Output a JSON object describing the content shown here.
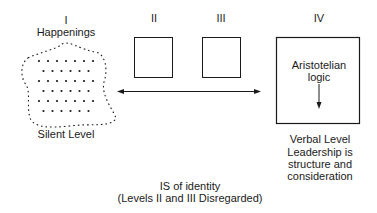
{
  "levels": [
    {
      "numeral": "I",
      "title": "Happenings",
      "caption": "Silent Level"
    },
    {
      "numeral": "II"
    },
    {
      "numeral": "III"
    },
    {
      "numeral": "IV",
      "box_text_line1": "Aristotelian",
      "box_text_line2": "logic",
      "caption": "Verbal Level",
      "statement": [
        "Leadership is",
        "structure and",
        "consideration"
      ]
    }
  ],
  "bottom_caption": {
    "line1": "IS of identity",
    "line2": "(Levels II and III Disregarded)"
  },
  "colors": {
    "ink": "#1a1a1a",
    "background": "#ffffff"
  }
}
